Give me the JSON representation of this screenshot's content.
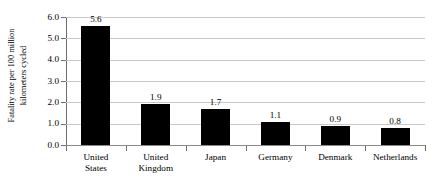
{
  "chart_data": {
    "type": "bar",
    "title": "",
    "subtitle": "",
    "xlabel": "",
    "ylabel": "Fatality rate per 100 million kilometers cycled",
    "ylabel_lines": [
      "Fatality rate per 100 million",
      "kilometers cycled"
    ],
    "categories": [
      "United States",
      "United Kingdom",
      "Japan",
      "Germany",
      "Denmark",
      "Netherlands"
    ],
    "category_lines": [
      [
        "United",
        "States"
      ],
      [
        "United",
        "Kingdom"
      ],
      [
        "Japan"
      ],
      [
        "Germany"
      ],
      [
        "Denmark"
      ],
      [
        "Netherlands"
      ]
    ],
    "values": [
      5.6,
      1.9,
      1.7,
      1.1,
      0.9,
      0.8
    ],
    "value_labels": [
      "5.6",
      "1.9",
      "1.7",
      "1.1",
      "0.9",
      "0.8"
    ],
    "ylim": [
      0.0,
      6.0
    ],
    "ytick_values": [
      0.0,
      1.0,
      2.0,
      3.0,
      4.0,
      5.0,
      6.0
    ],
    "ytick_labels": [
      "0.0",
      "1.0",
      "2.0",
      "3.0",
      "4.0",
      "5.0",
      "6.0"
    ],
    "grid": true,
    "grid_axis": "y",
    "legend": false,
    "legend_position": "none",
    "bar_color": "#000000",
    "grid_color": "#c9c9c9",
    "axis_color": "#6e6e6e",
    "text_color": "#000000",
    "background_color": "#ffffff"
  }
}
